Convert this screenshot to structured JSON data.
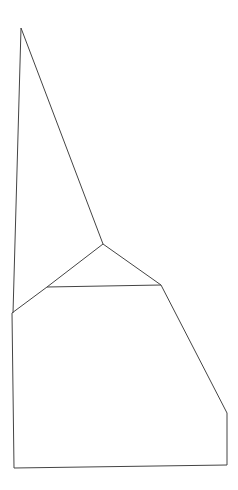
{
  "drawing": {
    "background": "#ffffff",
    "stroke": "#444444",
    "stroke_width": 1,
    "polylines": [
      {
        "name": "peak-left-edge",
        "points": [
          [
            21,
            28
          ],
          [
            13,
            313
          ]
        ]
      },
      {
        "name": "peak-right-edge",
        "points": [
          [
            21,
            28
          ],
          [
            103,
            244
          ]
        ]
      },
      {
        "name": "inner-left-edge",
        "points": [
          [
            103,
            244
          ],
          [
            47,
            287
          ],
          [
            12,
            313
          ]
        ]
      },
      {
        "name": "inner-right-edge",
        "points": [
          [
            103,
            244
          ],
          [
            161,
            285
          ]
        ]
      },
      {
        "name": "inner-base",
        "points": [
          [
            47,
            287
          ],
          [
            161,
            285
          ]
        ]
      },
      {
        "name": "right-slope",
        "points": [
          [
            161,
            285
          ],
          [
            227,
            413
          ],
          [
            227,
            465
          ]
        ]
      },
      {
        "name": "left-wall",
        "points": [
          [
            12,
            313
          ],
          [
            14,
            468
          ]
        ]
      },
      {
        "name": "bottom-edge",
        "points": [
          [
            14,
            468
          ],
          [
            227,
            465
          ]
        ]
      }
    ]
  }
}
